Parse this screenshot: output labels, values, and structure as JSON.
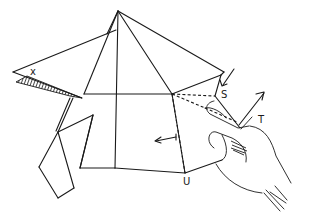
{
  "figure": {
    "type": "origami-folding-diagram",
    "background": "#ffffff",
    "ink_color": "#1a1a1a",
    "labels": {
      "x": "x",
      "s": "S",
      "t": "T",
      "u": "U"
    },
    "arrows": [
      {
        "name": "push-arrow-at-S",
        "direction": "down-left"
      },
      {
        "name": "lift-arrow-at-T",
        "direction": "up-right"
      },
      {
        "name": "fold-arrow-left",
        "direction": "left"
      }
    ],
    "elements": [
      "pyramid-model",
      "shaded-flap",
      "dashed-fold-lines",
      "hand"
    ]
  }
}
